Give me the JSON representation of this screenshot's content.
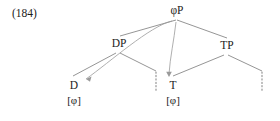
{
  "example": {
    "number": "(184)"
  },
  "tree": {
    "nodes": [
      {
        "id": "phiP",
        "label": "φP"
      },
      {
        "id": "DP",
        "label": "DP"
      },
      {
        "id": "TP",
        "label": "TP"
      },
      {
        "id": "D",
        "label": "D"
      },
      {
        "id": "T",
        "label": "T"
      }
    ],
    "features": [
      {
        "id": "feat-D",
        "label": "[φ]"
      },
      {
        "id": "feat-T",
        "label": "[φ]"
      }
    ],
    "edges": [
      {
        "from": "phiP",
        "to": "DP"
      },
      {
        "from": "phiP",
        "to": "TP"
      },
      {
        "from": "DP",
        "to": "D"
      },
      {
        "from": "DP",
        "to": "dp-gap"
      },
      {
        "from": "TP",
        "to": "T"
      },
      {
        "from": "TP",
        "to": "tp-gap"
      }
    ],
    "arrows": [
      {
        "from": "phiP",
        "to": "D"
      },
      {
        "from": "phiP",
        "to": "T"
      }
    ],
    "dotted_nodes": [
      "dp-gap",
      "tp-gap"
    ],
    "colors": {
      "line": "#7a7a7a",
      "arrow": "#9a9a9a",
      "dotted": "#8a8a8a",
      "text": "#1c1c1c"
    }
  }
}
